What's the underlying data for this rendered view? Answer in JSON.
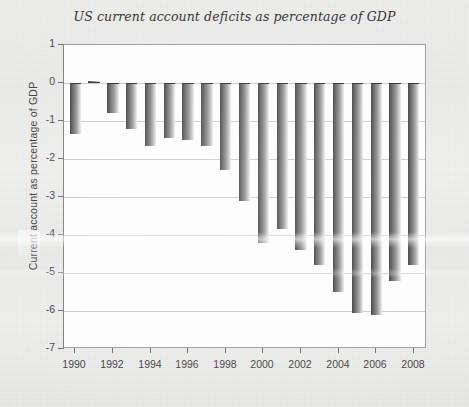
{
  "chart_data": {
    "type": "bar",
    "title": "US current account deficits as percentage of GDP",
    "xlabel": "",
    "ylabel": "Current account as percentage of GDP",
    "categories": [
      1990,
      1991,
      1992,
      1993,
      1994,
      1995,
      1996,
      1997,
      1998,
      1999,
      2000,
      2001,
      2002,
      2003,
      2004,
      2005,
      2006,
      2007,
      2008
    ],
    "values": [
      -1.35,
      0.05,
      -0.8,
      -1.2,
      -1.65,
      -1.45,
      -1.5,
      -1.65,
      -2.3,
      -3.1,
      -4.2,
      -3.85,
      -4.4,
      -4.8,
      -5.5,
      -6.05,
      -6.1,
      -5.2,
      -4.8
    ],
    "ylim": [
      -7,
      1
    ],
    "yticks": [
      1,
      0,
      -1,
      -2,
      -3,
      -4,
      -5,
      -6,
      -7
    ],
    "ytick_labels": [
      "1",
      "0",
      "-1",
      "-2",
      "-3",
      "-4",
      "-5",
      "-6",
      "-7"
    ],
    "xticks": [
      1990,
      1992,
      1994,
      1996,
      1998,
      2000,
      2002,
      2004,
      2006,
      2008
    ],
    "xtick_labels": [
      "1990",
      "1992",
      "1994",
      "1996",
      "1998",
      "2000",
      "2002",
      "2004",
      "2006",
      "2008"
    ],
    "xlim": [
      1989.4,
      2008.7
    ],
    "grid": true,
    "grid_axis": "y",
    "legend": null,
    "bar_color": "#5a5a5a",
    "bar_gradient": [
      "#3a3a3a",
      "#efefef"
    ],
    "plot_background": "#fdfdfd",
    "page_background": "#e9e9e7"
  }
}
